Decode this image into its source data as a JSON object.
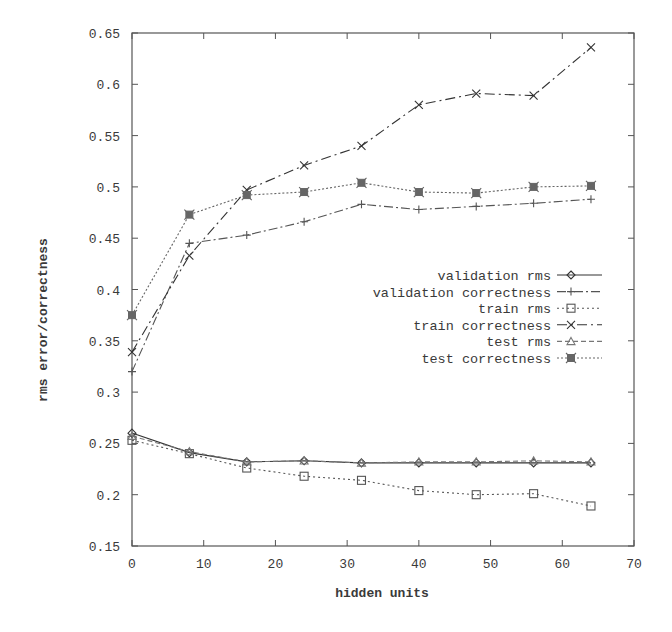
{
  "chart_data": {
    "type": "line",
    "title": "",
    "xlabel": "hidden units",
    "ylabel": "rms error/correctness",
    "xlim": [
      0,
      70
    ],
    "ylim": [
      0.15,
      0.65
    ],
    "xticks": [
      0,
      10,
      20,
      30,
      40,
      50,
      60,
      70
    ],
    "xtick_labels": [
      "0",
      "10",
      "20",
      "30",
      "40",
      "50",
      "60",
      "70"
    ],
    "yticks": [
      0.15,
      0.2,
      0.25,
      0.3,
      0.35,
      0.4,
      0.45,
      0.5,
      0.55,
      0.6,
      0.65
    ],
    "ytick_labels": [
      "0.15",
      "0.2",
      "0.25",
      "0.3",
      "0.35",
      "0.4",
      "0.45",
      "0.5",
      "0.55",
      "0.6",
      "0.65"
    ],
    "grid": false,
    "legend_position": "center-right",
    "x": [
      0,
      8,
      16,
      24,
      32,
      40,
      48,
      56,
      64
    ],
    "series": [
      {
        "name": "validation rms",
        "marker": "diamond",
        "dash": "",
        "color": "#333333",
        "values": [
          0.26,
          0.241,
          0.232,
          0.233,
          0.231,
          0.231,
          0.231,
          0.231,
          0.231
        ]
      },
      {
        "name": "validation correctness",
        "marker": "plus",
        "dash": "9,3,2,3",
        "color": "#555555",
        "values": [
          0.32,
          0.445,
          0.453,
          0.466,
          0.483,
          0.478,
          0.481,
          0.484,
          0.488
        ]
      },
      {
        "name": "train rms",
        "marker": "square",
        "dash": "2,3",
        "color": "#555555",
        "values": [
          0.253,
          0.24,
          0.226,
          0.218,
          0.214,
          0.204,
          0.2,
          0.201,
          0.189
        ]
      },
      {
        "name": "train correctness",
        "marker": "cross",
        "dash": "10,4,2,4",
        "color": "#333333",
        "values": [
          0.339,
          0.433,
          0.497,
          0.521,
          0.54,
          0.58,
          0.591,
          0.589,
          0.636
        ]
      },
      {
        "name": "test rms",
        "marker": "triangle",
        "dash": "5,3",
        "color": "#777777",
        "values": [
          0.257,
          0.242,
          0.232,
          0.233,
          0.231,
          0.232,
          0.232,
          0.233,
          0.232
        ]
      },
      {
        "name": "test correctness",
        "marker": "star",
        "dash": "2,2",
        "color": "#666666",
        "values": [
          0.375,
          0.473,
          0.492,
          0.495,
          0.504,
          0.495,
          0.494,
          0.5,
          0.501
        ]
      }
    ]
  }
}
